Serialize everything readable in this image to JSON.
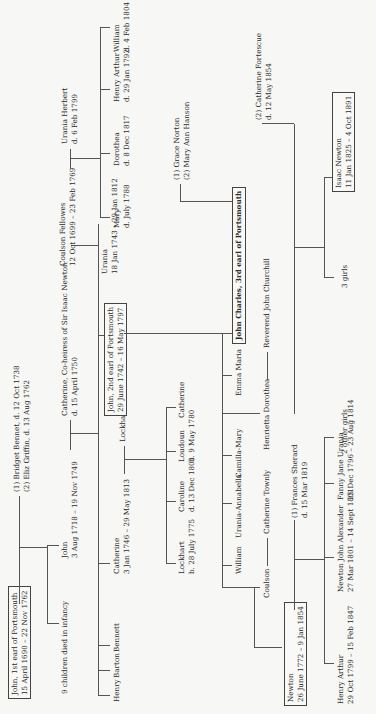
{
  "diagram": {
    "type": "family-tree",
    "orientation": "rotated-90-ccw",
    "line_color": "#555555",
    "text_color": "#2b2b2b",
    "background": "#f7f7f5"
  },
  "generation1": {
    "john_1st_earl": {
      "name": "John, 1st earl of Portsmouth",
      "dates": "15 April 1690 – 22 Nov 1762"
    },
    "spouses": {
      "line1": "(1) Bridget Bennet, d. 12 Oct 1738",
      "line2": "(2) Eliz Griffin, d. 13 Aug 1762"
    }
  },
  "generation2": {
    "infants": {
      "name": "9 children died in infancy"
    },
    "john": {
      "name": "John",
      "dates": "3 Aug 1718 – 19 Nov 1749"
    },
    "catherine_spouse": {
      "name": "Catherine, Co-heiress of Sir Isaac Newton",
      "dates": "d. 15 April 1750"
    }
  },
  "generation3": {
    "henry": {
      "name": "Henry"
    },
    "barton": {
      "name": "Barton"
    },
    "bennett": {
      "name": "Bennett"
    },
    "catherine": {
      "name": "Catherine",
      "dates": "3 Jan 1746 – 29 May 1813"
    },
    "lockhart_gordon": {
      "name": "Lockhart Gordon"
    },
    "john_2nd_earl": {
      "name": "John, 2nd earl of Portsmouth",
      "dates": "29 June 1742 – 16 May 1797"
    },
    "urania": {
      "name": "Urania",
      "dates": "18 Jan 1743 – 29 Jan 1812"
    },
    "coulson_fellowes": {
      "name": "Coulson Fellowes",
      "dates": "12 Oct 1699 – 23 Feb 1769"
    },
    "urania_herbert": {
      "name": "Urania Herbert",
      "dates": "d. 6 Feb 1799"
    }
  },
  "gordon_children": {
    "lockhart": {
      "name": "Lockhart",
      "dates": "b. 28 July 1775"
    },
    "caroline": {
      "name": "Caroline",
      "dates": "d. 13 Dec 1801"
    },
    "loudoun": {
      "name": "Loudoun",
      "dates": "b. 9 May 1780"
    },
    "catherine": {
      "name": "Catherine"
    }
  },
  "fellowes_children": {
    "mary": {
      "name": "Mary",
      "dates": "d. July 1788"
    },
    "dorothea": {
      "name": "Dorothea",
      "dates": "d. 8 Dec 1817"
    },
    "henry_arthur": {
      "name": "Henry Arthur",
      "dates": "d. 29 Jan 1792"
    },
    "william": {
      "name": "William",
      "dates": "d. 4 Feb 1804"
    }
  },
  "generation4": {
    "coulson": {
      "name": "Coulson"
    },
    "catherine_townly": {
      "name": "Catherine Townly"
    },
    "william": {
      "name": "William"
    },
    "urania_annabella": {
      "name": "Urania-Annabella"
    },
    "camilla_mary": {
      "name": "Camilla-Mary"
    },
    "henrietta_dorothea": {
      "name": "Henrietta Dorothea"
    },
    "reverend_john_churchill": {
      "name": "Reverend John Churchill"
    },
    "emma_maria": {
      "name": "Emma Maria"
    },
    "john_charles_3rd_earl": {
      "name": "John Charles, 3rd earl of Portsmouth"
    },
    "john_charles_spouses": {
      "line1": "(1) Grace Norton",
      "line2": "(2) Mary Ann Hanson"
    },
    "newton": {
      "name": "Newton",
      "dates": "26 June 1772 – 9 Jan 1854"
    },
    "frances_sherard": {
      "name": "(1) Frances Sherard",
      "dates": "d. 15 Mar 1819"
    },
    "catherine_fortescue": {
      "name": "(2) Catherine Fortescue",
      "dates": "d. 12 May 1854"
    }
  },
  "generation5": {
    "henry_arthur": {
      "name": "Henry Arthur",
      "dates": "29 Oct 1799 – 15 Feb 1847"
    },
    "newton_john_alexander": {
      "name": "Newton John Alexander",
      "dates": "27 Mar 1801 – 14 Sept 1801"
    },
    "fanny_jane_urania": {
      "name": "Fanny Jane Urania",
      "dates": "25 Dec 1796 – 23 Aug 1814"
    },
    "other_girls": {
      "name": "2 other girls"
    },
    "three_girls": {
      "name": "3 girls"
    },
    "isaac_newton": {
      "name": "Isaac Newton",
      "dates": "11 Jan 1825 – 4 Oct 1891"
    }
  }
}
